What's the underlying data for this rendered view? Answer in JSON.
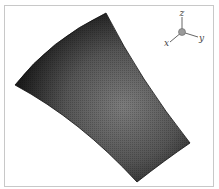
{
  "figure": {
    "surface": {
      "vertices": {
        "top": [
          106,
          13
        ],
        "left": [
          15,
          85
        ],
        "bottom": [
          137,
          182
        ],
        "right": [
          190,
          143
        ]
      },
      "colors": {
        "edge": "#1a1a1a",
        "center": "#7a7a7a"
      }
    },
    "axis_triad": {
      "labels": {
        "z": "z",
        "x": "x",
        "y": "y"
      },
      "origin_color": "#999999"
    }
  }
}
